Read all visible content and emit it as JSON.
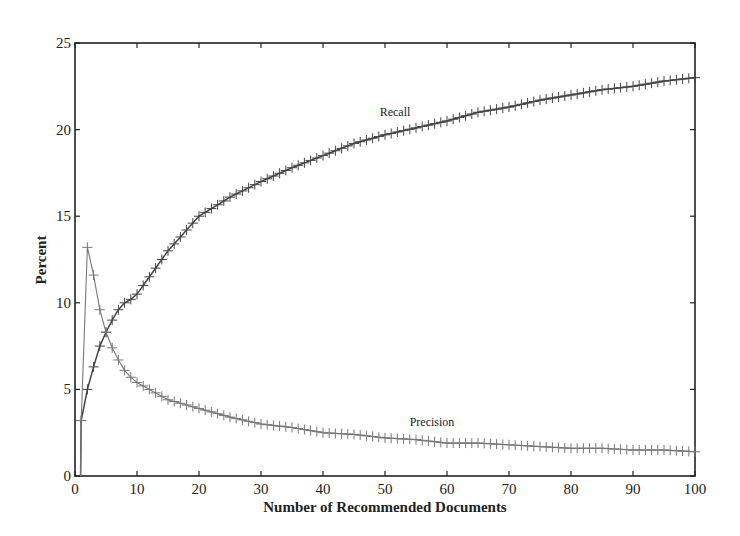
{
  "chart_data": {
    "type": "line",
    "title": "",
    "xlabel": "Number of Recommended Documents",
    "ylabel": "Percent",
    "xlim": [
      0,
      100
    ],
    "ylim": [
      0,
      25
    ],
    "xticks": [
      0,
      10,
      20,
      30,
      40,
      50,
      60,
      70,
      80,
      90,
      100
    ],
    "yticks": [
      0,
      5,
      10,
      15,
      20,
      25
    ],
    "grid": false,
    "legend": "none (inline annotations)",
    "annotations": [
      {
        "text": "Recall",
        "x": 48,
        "y": 20.8
      },
      {
        "text": "Precision",
        "x": 51,
        "y": 3.0
      }
    ],
    "marker": "+",
    "series": [
      {
        "name": "Recall",
        "color": "#444444",
        "key_points": {
          "x": [
            1,
            2,
            3,
            4,
            5,
            6,
            7,
            8,
            9,
            10,
            15,
            20,
            25,
            30,
            35,
            40,
            45,
            50,
            55,
            60,
            65,
            70,
            75,
            80,
            85,
            90,
            95,
            100
          ],
          "y": [
            3.2,
            5.0,
            6.3,
            7.5,
            8.3,
            9.0,
            9.6,
            10.0,
            10.2,
            10.5,
            13.0,
            15.0,
            16.1,
            17.0,
            17.8,
            18.5,
            19.2,
            19.7,
            20.1,
            20.5,
            21.0,
            21.3,
            21.7,
            22.0,
            22.3,
            22.5,
            22.8,
            23.0
          ]
        }
      },
      {
        "name": "Precision",
        "color": "#777777",
        "key_points": {
          "x": [
            1,
            2,
            3,
            4,
            5,
            6,
            7,
            8,
            9,
            10,
            15,
            20,
            25,
            30,
            35,
            40,
            45,
            50,
            55,
            60,
            65,
            70,
            75,
            80,
            85,
            90,
            95,
            100
          ],
          "y": [
            3.2,
            13.2,
            11.6,
            9.6,
            8.3,
            7.4,
            6.7,
            6.1,
            5.7,
            5.4,
            4.4,
            3.9,
            3.4,
            3.0,
            2.8,
            2.5,
            2.4,
            2.2,
            2.1,
            1.9,
            1.9,
            1.8,
            1.7,
            1.6,
            1.6,
            1.5,
            1.5,
            1.4
          ]
        }
      }
    ]
  },
  "labels": {
    "xlabel": "Number of Recommended Documents",
    "ylabel": "Percent",
    "recall": "Recall",
    "precision": "Precision"
  }
}
